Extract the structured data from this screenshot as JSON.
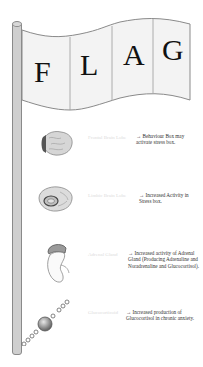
{
  "flag": {
    "letters": [
      "F",
      "L",
      "A",
      "G"
    ]
  },
  "items": [
    {
      "icon": "brain-frontal-icon",
      "label": "Frontal Brain Lobe",
      "description": "→ Behaviour Box may activate stress box."
    },
    {
      "icon": "brain-limbic-icon",
      "label": "Limbic Brain Lobe",
      "description": "→ Increased Activity in Stress box."
    },
    {
      "icon": "adrenal-gland-icon",
      "label": "Adrenal Gland",
      "description": "→ Increased activity of Adrenal Gland (Producing Adrenaline and Noradrenaline and Glucocortisol)."
    },
    {
      "icon": "glucocorticoid-molecule-icon",
      "label": "Glucocorticoid",
      "description": "→ Increased production of Glucocortisol in chronic anxiety."
    }
  ],
  "colors": {
    "pole": "#cfcfcf",
    "flag_fill": "#f3f3f3",
    "outline": "#8a8a8a",
    "text": "#111111",
    "faint_label": "#dcdcdc"
  }
}
